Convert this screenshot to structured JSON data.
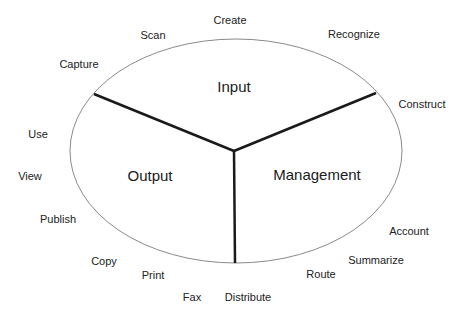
{
  "diagram": {
    "colors": {
      "ellipse_stroke": "#8a8a8a",
      "divider": "#1a1a1a",
      "text": "#222222",
      "background": "#ffffff"
    },
    "ellipse": {
      "cx": 236,
      "cy": 151,
      "rx": 166,
      "ry": 112
    },
    "center": {
      "x": 234,
      "y": 151
    },
    "dividers": [
      {
        "x1": 234,
        "y1": 151,
        "x2": 94,
        "y2": 94
      },
      {
        "x1": 234,
        "y1": 151,
        "x2": 376,
        "y2": 93
      },
      {
        "x1": 234,
        "y1": 151,
        "x2": 235,
        "y2": 263
      }
    ],
    "sections": [
      {
        "label": "Input",
        "x": 234,
        "y": 86
      },
      {
        "label": "Output",
        "x": 150,
        "y": 175
      },
      {
        "label": "Management",
        "x": 317,
        "y": 174
      }
    ],
    "activities": [
      {
        "label": "Create",
        "x": 230,
        "y": 20
      },
      {
        "label": "Scan",
        "x": 153,
        "y": 35
      },
      {
        "label": "Recognize",
        "x": 354,
        "y": 34
      },
      {
        "label": "Capture",
        "x": 79,
        "y": 64
      },
      {
        "label": "Construct",
        "x": 422,
        "y": 104
      },
      {
        "label": "Use",
        "x": 38,
        "y": 134
      },
      {
        "label": "View",
        "x": 30,
        "y": 176
      },
      {
        "label": "Publish",
        "x": 58,
        "y": 219
      },
      {
        "label": "Account",
        "x": 409,
        "y": 231
      },
      {
        "label": "Summarize",
        "x": 376,
        "y": 260
      },
      {
        "label": "Copy",
        "x": 104,
        "y": 261
      },
      {
        "label": "Route",
        "x": 321,
        "y": 274
      },
      {
        "label": "Print",
        "x": 153,
        "y": 275
      },
      {
        "label": "Fax",
        "x": 192,
        "y": 297
      },
      {
        "label": "Distribute",
        "x": 248,
        "y": 297
      }
    ]
  }
}
